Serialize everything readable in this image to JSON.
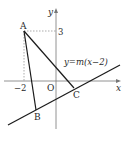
{
  "diagram": {
    "axes": {
      "x_label": "x",
      "y_label": "y",
      "origin_label": "O"
    },
    "points": {
      "A": {
        "label": "A",
        "coords": [
          -2,
          3
        ]
      },
      "B": {
        "label": "B"
      },
      "C": {
        "label": "C"
      }
    },
    "tick_labels": {
      "x_tick": "−2",
      "y_tick": "3"
    },
    "line_equation": "y=m(x−2)",
    "colors": {
      "stroke": "#1a1a1a",
      "dashed": "#888888"
    }
  }
}
